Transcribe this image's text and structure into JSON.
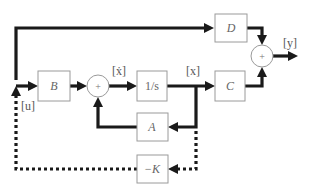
{
  "diagram": {
    "type": "state-space block diagram with state feedback",
    "blocks": {
      "B": "B",
      "integrator": "1/s",
      "C": "C",
      "D": "D",
      "A": "A",
      "K": "−K"
    },
    "summing_junctions": {
      "sum1": "+",
      "sum2": "+"
    },
    "signals": {
      "u": "[u]",
      "xdot": "[ẋ]",
      "x": "[x]",
      "y": "[y]"
    },
    "colors": {
      "wire": "#1a1a1a",
      "block_border": "#9a9a9a",
      "label": "#666666"
    }
  }
}
